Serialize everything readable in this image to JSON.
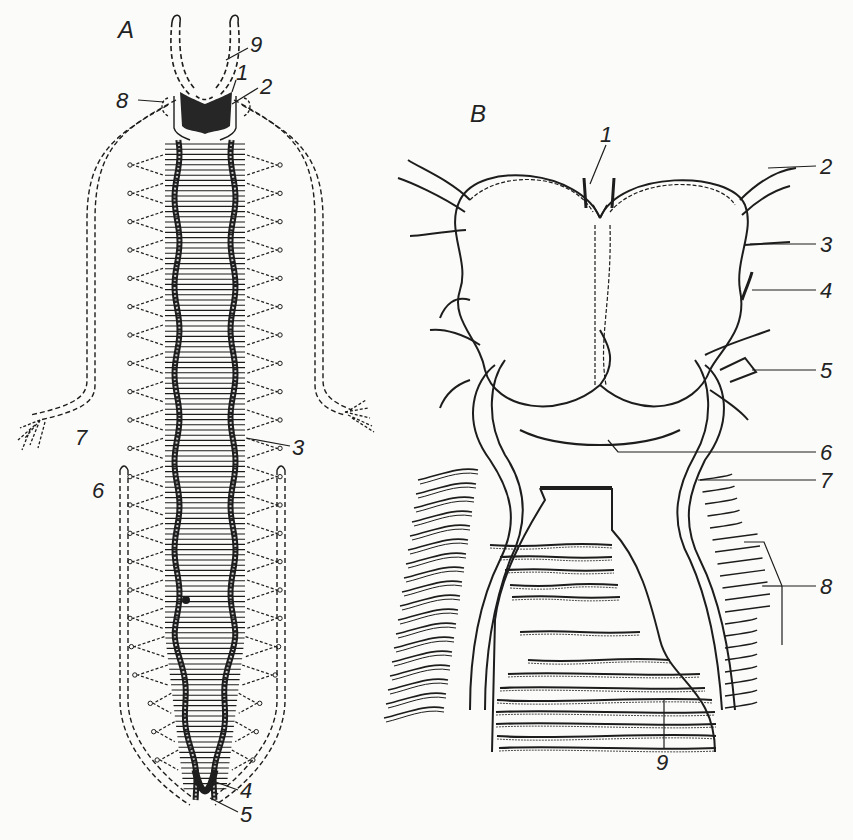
{
  "figure": {
    "panels": [
      {
        "id": "A",
        "label": "A",
        "callouts": [
          {
            "num": "1",
            "label": "1"
          },
          {
            "num": "2",
            "label": "2"
          },
          {
            "num": "3",
            "label": "3"
          },
          {
            "num": "4",
            "label": "4"
          },
          {
            "num": "5",
            "label": "5"
          },
          {
            "num": "6",
            "label": "6"
          },
          {
            "num": "7",
            "label": "7"
          },
          {
            "num": "8",
            "label": "8"
          },
          {
            "num": "9",
            "label": "9"
          }
        ],
        "segments": 22
      },
      {
        "id": "B",
        "label": "B",
        "callouts": [
          {
            "num": "1",
            "label": "1"
          },
          {
            "num": "2",
            "label": "2"
          },
          {
            "num": "3",
            "label": "3"
          },
          {
            "num": "4",
            "label": "4"
          },
          {
            "num": "5",
            "label": "5"
          },
          {
            "num": "6",
            "label": "6"
          },
          {
            "num": "7",
            "label": "7"
          },
          {
            "num": "8",
            "label": "8"
          },
          {
            "num": "9",
            "label": "9"
          }
        ]
      }
    ],
    "ink_color": "#1d1d1d",
    "paper_color": "#fbfbf9"
  }
}
